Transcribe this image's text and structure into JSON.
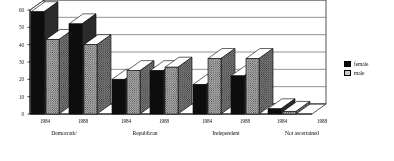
{
  "chart_data": {
    "type": "bar",
    "title": "",
    "subtitle": "",
    "xlabel": "",
    "ylabel": "",
    "ylim": [
      0,
      60
    ],
    "yticks": [
      0,
      10,
      20,
      30,
      40,
      50,
      60
    ],
    "grid": true,
    "legend_position": "right",
    "orientation": "vertical",
    "style": "3d-grouped-bars",
    "groups": [
      "Democratic",
      "Republican",
      "Independent",
      "Not ascertained"
    ],
    "years": [
      "1984",
      "1988"
    ],
    "categories": [
      "Democratic 1984",
      "Democratic 1988",
      "Republican 1984",
      "Republican 1988",
      "Independent 1984",
      "Independent 1988",
      "Not ascertained 1984",
      "Not ascertained 1988"
    ],
    "series": [
      {
        "name": "female",
        "color": "#0d0d0d",
        "fill": "solid-black",
        "values": [
          59,
          52,
          20,
          25,
          17,
          22,
          3,
          0
        ]
      },
      {
        "name": "male",
        "color": "#c9c9c9",
        "fill": "dotted-gray",
        "values": [
          43,
          40,
          25,
          27,
          32,
          32,
          1.5,
          0
        ]
      }
    ]
  },
  "axis": {
    "y_tick_labels": [
      "0",
      "10",
      "20",
      "30",
      "40",
      "50",
      "60"
    ],
    "x_tick_labels": [
      "1984",
      "1988",
      "1984",
      "1988",
      "1984",
      "1988",
      "1984",
      "1988"
    ],
    "group_labels": [
      "Democratic",
      "Republican",
      "Independent",
      "Not ascertained"
    ]
  },
  "legend": {
    "items": [
      {
        "label": "female",
        "swatch": "solid-black-swatch"
      },
      {
        "label": "male",
        "swatch": "dotted-gray-swatch"
      }
    ]
  }
}
